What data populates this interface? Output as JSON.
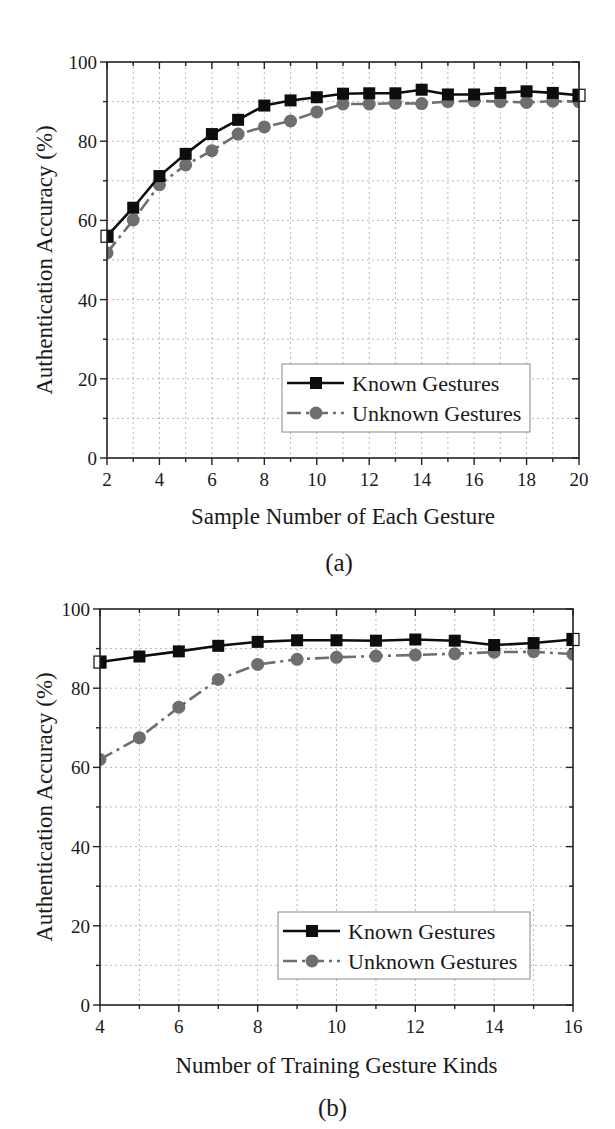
{
  "figure": {
    "panels": [
      {
        "id": "a",
        "panel_label": "(a)",
        "xlabel": "Sample Number of Each Gesture",
        "ylabel": "Authentication Accuracy (%)",
        "x_ticks": [
          "2",
          "4",
          "6",
          "8",
          "10",
          "12",
          "14",
          "16",
          "18",
          "20"
        ],
        "y_ticks": [
          "0",
          "20",
          "40",
          "60",
          "80",
          "100"
        ],
        "legend": [
          "Known Gestures",
          "Unknown Gestures"
        ]
      },
      {
        "id": "b",
        "panel_label": "(b)",
        "xlabel": "Number of Training Gesture Kinds",
        "ylabel": "Authentication Accuracy (%)",
        "x_ticks": [
          "4",
          "6",
          "8",
          "10",
          "12",
          "14",
          "16"
        ],
        "y_ticks": [
          "0",
          "20",
          "40",
          "60",
          "80",
          "100"
        ],
        "legend": [
          "Known Gestures",
          "Unknown Gestures"
        ]
      }
    ],
    "colors": {
      "known": "#0d0d0d",
      "unknown": "#6e6e6e",
      "grid": "#b8b8b8"
    }
  },
  "chart_data": [
    {
      "type": "line",
      "title": "(a)",
      "xlabel": "Sample Number of Each Gesture",
      "ylabel": "Authentication Accuracy (%)",
      "xlim": [
        2,
        20
      ],
      "ylim": [
        0,
        100
      ],
      "x_ticks": [
        2,
        4,
        6,
        8,
        10,
        12,
        14,
        16,
        18,
        20
      ],
      "y_ticks": [
        0,
        20,
        40,
        60,
        80,
        100
      ],
      "grid": true,
      "legend_position": "lower right",
      "x": [
        2,
        3,
        4,
        5,
        6,
        7,
        8,
        9,
        10,
        11,
        12,
        13,
        14,
        15,
        16,
        17,
        18,
        19,
        20
      ],
      "series": [
        {
          "name": "Known Gestures",
          "marker": "square",
          "line": "solid",
          "values": [
            56.0,
            63.2,
            71.2,
            76.8,
            81.8,
            85.4,
            89.0,
            90.3,
            91.1,
            92.0,
            92.1,
            92.1,
            93.0,
            91.8,
            91.8,
            92.2,
            92.6,
            92.2,
            91.6
          ]
        },
        {
          "name": "Unknown Gestures",
          "marker": "circle",
          "line": "dash-dot",
          "values": [
            51.8,
            60.1,
            69.0,
            74.0,
            77.6,
            81.8,
            83.6,
            85.1,
            87.4,
            89.4,
            89.4,
            89.6,
            89.5,
            90.0,
            90.2,
            90.0,
            89.8,
            90.1,
            90.0
          ]
        }
      ]
    },
    {
      "type": "line",
      "title": "(b)",
      "xlabel": "Number of Training Gesture Kinds",
      "ylabel": "Authentication Accuracy (%)",
      "xlim": [
        4,
        16
      ],
      "ylim": [
        0,
        100
      ],
      "x_ticks": [
        4,
        6,
        8,
        10,
        12,
        14,
        16
      ],
      "y_ticks": [
        0,
        20,
        40,
        60,
        80,
        100
      ],
      "grid": true,
      "legend_position": "lower right",
      "x": [
        4,
        5,
        6,
        7,
        8,
        9,
        10,
        11,
        12,
        13,
        14,
        15,
        16
      ],
      "series": [
        {
          "name": "Known Gestures",
          "marker": "square",
          "line": "solid",
          "values": [
            86.6,
            88.0,
            89.3,
            90.7,
            91.7,
            92.1,
            92.1,
            92.0,
            92.3,
            92.0,
            90.9,
            91.4,
            92.3
          ]
        },
        {
          "name": "Unknown Gestures",
          "marker": "circle",
          "line": "dash-dot",
          "values": [
            62.0,
            67.5,
            75.2,
            82.2,
            86.0,
            87.3,
            87.8,
            88.1,
            88.4,
            88.7,
            89.1,
            89.2,
            88.6
          ]
        }
      ]
    }
  ]
}
